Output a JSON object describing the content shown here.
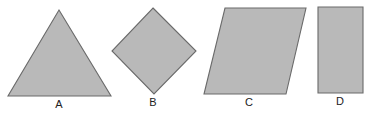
{
  "diagram": {
    "width": 368,
    "height": 113,
    "colors": {
      "background": "#ffffff",
      "fill": "#b9b9b9",
      "stroke": "#6a6a6a",
      "label": "#222222"
    },
    "shapes": [
      {
        "id": "A",
        "type": "triangle",
        "label": "A",
        "points": [
          [
            59,
            10
          ],
          [
            111,
            96
          ],
          [
            8,
            96
          ]
        ],
        "label_pos": [
          59,
          108
        ]
      },
      {
        "id": "B",
        "type": "square-rotated",
        "label": "B",
        "points": [
          [
            153,
            8
          ],
          [
            196,
            51
          ],
          [
            154,
            94
          ],
          [
            112,
            51
          ]
        ],
        "label_pos": [
          153,
          106
        ]
      },
      {
        "id": "C",
        "type": "parallelogram",
        "label": "C",
        "points": [
          [
            225,
            8
          ],
          [
            306,
            8
          ],
          [
            286,
            94
          ],
          [
            204,
            94
          ]
        ],
        "label_pos": [
          249,
          106
        ]
      },
      {
        "id": "D",
        "type": "rectangle",
        "label": "D",
        "points": [
          [
            318,
            7
          ],
          [
            363,
            7
          ],
          [
            363,
            93
          ],
          [
            318,
            93
          ]
        ],
        "label_pos": [
          340,
          105
        ]
      }
    ]
  }
}
